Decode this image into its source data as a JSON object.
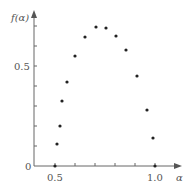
{
  "chart_data": {
    "type": "scatter",
    "title": "",
    "xlabel": "α",
    "ylabel": "f(α)",
    "xlim": [
      0.4,
      1.1
    ],
    "ylim": [
      0,
      0.75
    ],
    "x_ticks": [
      0.5,
      0.6,
      0.7,
      0.8,
      0.9,
      1.0
    ],
    "x_tick_labels": [
      "0.5",
      "",
      "",
      "",
      "",
      "1.0"
    ],
    "y_ticks": [
      0,
      0.1,
      0.2,
      0.3,
      0.4,
      0.5,
      0.6,
      0.7
    ],
    "y_tick_labels": [
      "0",
      "",
      "",
      "",
      "",
      "0.5",
      "",
      ""
    ],
    "grid": false,
    "legend": null,
    "series": [
      {
        "name": "f(α)",
        "x": [
          0.5,
          0.51,
          0.525,
          0.535,
          0.56,
          0.6,
          0.65,
          0.705,
          0.755,
          0.805,
          0.855,
          0.91,
          0.96,
          0.99,
          1.0
        ],
        "y": [
          0.0,
          0.11,
          0.2,
          0.325,
          0.42,
          0.55,
          0.645,
          0.695,
          0.69,
          0.65,
          0.58,
          0.45,
          0.28,
          0.14,
          0.0
        ]
      }
    ]
  },
  "labels": {
    "y_axis": "f(α)",
    "x_axis": "α",
    "origin": "0",
    "y_half": "0.5",
    "x_half": "0.5",
    "x_one": "1.0"
  },
  "colors": {
    "axis": "#666666",
    "point": "#222222",
    "text": "#555555"
  }
}
